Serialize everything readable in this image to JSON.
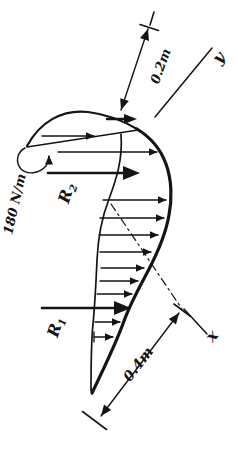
{
  "figure_labels": {
    "distributed_load": "180 N/m",
    "r1_base": "R",
    "r1_sub": "1",
    "r2_base": "R",
    "r2_sub": "2",
    "dim_curve_radius": "0.2m",
    "dim_straight_length": "0.4m",
    "axis_x": "x",
    "axis_y": "y"
  },
  "colors": {
    "ink": "#141414",
    "paper": "#ffffff"
  }
}
